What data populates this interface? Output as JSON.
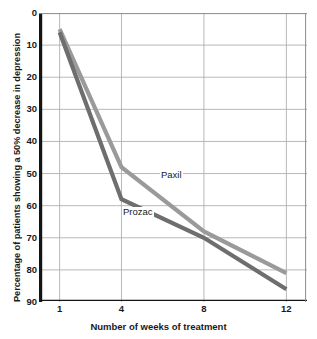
{
  "chart_data": {
    "type": "line",
    "title": "",
    "subtitle": "",
    "xlabel": "Number of weeks of treatment",
    "ylabel": "Percentage of patients showing a 50% decrease in depression",
    "x": [
      1,
      4,
      8,
      12
    ],
    "xticklabels": [
      "1",
      "4",
      "8",
      "12"
    ],
    "xlim": [
      0,
      13
    ],
    "ylim": [
      0,
      90
    ],
    "y_inverted": true,
    "yticks": [
      0,
      10,
      20,
      30,
      40,
      50,
      60,
      70,
      80,
      90
    ],
    "yticklabels": [
      "0",
      "10",
      "20",
      "30",
      "40",
      "50",
      "60",
      "70",
      "80",
      "90"
    ],
    "grid": "both",
    "legend_position": "inline-annotation",
    "series": [
      {
        "name": "Paxil",
        "color": "#9a9a9a",
        "values": [
          5,
          48,
          68,
          81
        ]
      },
      {
        "name": "Prozac",
        "color": "#6e6e6e",
        "values": [
          6,
          58,
          70,
          86
        ]
      }
    ],
    "annotations": [
      {
        "text": "Paxil",
        "x": 5.6,
        "y": 54
      },
      {
        "text": "Prozac",
        "x": 3.8,
        "y": 64
      }
    ]
  },
  "colors": {
    "axis": "#141414",
    "grid": "#b0b0b0",
    "text": "#1a1a1a",
    "background": "#ffffff",
    "paxil": "#9a9a9a",
    "prozac": "#6e6e6e"
  }
}
